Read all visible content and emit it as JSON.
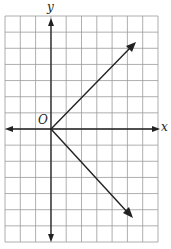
{
  "chart_data": {
    "type": "line",
    "title": "",
    "xlabel": "x",
    "ylabel": "y",
    "origin_label": "O",
    "grid": true,
    "grid_columns": 10,
    "grid_rows": 14,
    "xlim": [
      -3,
      7
    ],
    "ylim": [
      -7,
      7
    ],
    "series": [
      {
        "name": "upper ray",
        "x": [
          0,
          5.5
        ],
        "y": [
          0,
          5.5
        ]
      },
      {
        "name": "lower ray",
        "x": [
          0,
          5.5
        ],
        "y": [
          0,
          -5.5
        ]
      }
    ]
  },
  "colors": {
    "grid": "#9a9a9a",
    "axis": "#222222",
    "line": "#222222"
  }
}
